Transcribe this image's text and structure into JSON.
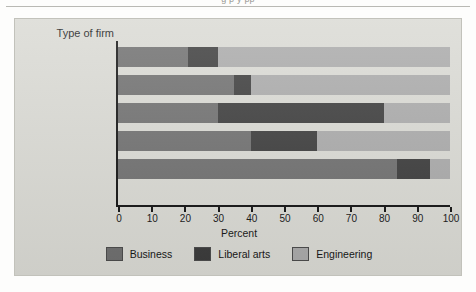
{
  "page": {
    "cut_off_header": "g  p  y pp"
  },
  "chart_data": {
    "type": "bar",
    "orientation": "horizontal",
    "stacked": true,
    "title": "",
    "category_axis_title": "Type of firm",
    "xlabel": "Percent",
    "ylabel": "",
    "xlim": [
      0,
      100
    ],
    "xticks": [
      "0",
      "10",
      "20",
      "30",
      "40",
      "50",
      "60",
      "70",
      "80",
      "90",
      "100"
    ],
    "grid": false,
    "legend_position": "bottom",
    "categories": [
      "Manufacturing",
      "Transportation",
      "Communications",
      "Utilities",
      "Finance and Banking"
    ],
    "series": [
      {
        "name": "Business",
        "color": "#6e6e6e",
        "values": [
          21,
          35,
          30,
          40,
          84
        ]
      },
      {
        "name": "Liberal arts",
        "color": "#3a3a3a",
        "values": [
          9,
          5,
          50,
          20,
          10
        ]
      },
      {
        "name": "Engineering",
        "color": "#a9a9a9",
        "values": [
          70,
          60,
          20,
          40,
          6
        ]
      }
    ]
  },
  "colors": {
    "panel_background": "#d9d9d3",
    "axis": "#111111",
    "text": "#161616"
  }
}
